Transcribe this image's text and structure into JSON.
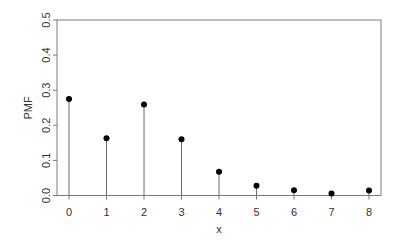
{
  "chart_data": {
    "type": "scatter",
    "subtype": "stem",
    "title": "",
    "xlabel": "x",
    "ylabel": "PMF",
    "x": [
      0,
      1,
      2,
      3,
      4,
      5,
      6,
      7,
      8
    ],
    "series": [
      {
        "name": "PMF",
        "values": [
          0.275,
          0.163,
          0.259,
          0.16,
          0.068,
          0.028,
          0.015,
          0.006,
          0.014
        ]
      }
    ],
    "xticks": [
      "0",
      "1",
      "2",
      "3",
      "4",
      "5",
      "6",
      "7",
      "8"
    ],
    "yticks": [
      "0.0",
      "0.1",
      "0.2",
      "0.3",
      "0.4",
      "0.5"
    ],
    "xlim": [
      -0.32,
      8.32
    ],
    "ylim": [
      0,
      0.5
    ],
    "grid": false,
    "legend": null
  },
  "colors": {
    "point": "#000000",
    "stem": "#6a6a6a",
    "axis": "#7a7a7a",
    "text": "#333333"
  }
}
